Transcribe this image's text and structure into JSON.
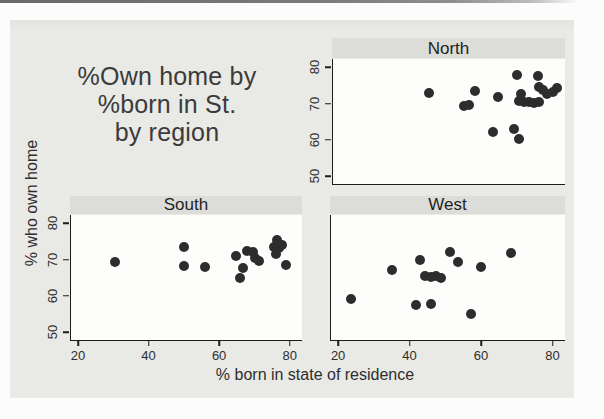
{
  "chart_data": {
    "type": "scatter",
    "title_lines": [
      "%Own home by",
      "%born in St.",
      "by region"
    ],
    "xlabel": "% born in state of residence",
    "ylabel": "% who own home",
    "facet_by": "region",
    "x_ticks": [
      20,
      40,
      60,
      80
    ],
    "y_ticks": [
      80,
      70,
      60,
      50
    ],
    "xlim": [
      18,
      83.5
    ],
    "ylim": [
      47.8,
      82.3
    ],
    "grid": false,
    "legend_position": "none",
    "panels": [
      {
        "label": "North",
        "position": "top-right",
        "show_y_tick_labels": true,
        "show_x_tick_labels": false,
        "points": [
          [
            45,
            73
          ],
          [
            58,
            73.5
          ],
          [
            55,
            69.2
          ],
          [
            56.5,
            69.7
          ],
          [
            64.5,
            71.7
          ],
          [
            70,
            77.8
          ],
          [
            71,
            72.7
          ],
          [
            70.5,
            70.8
          ],
          [
            72,
            70.4
          ],
          [
            73.3,
            70.5
          ],
          [
            74.7,
            70.1
          ],
          [
            76.1,
            70.4
          ],
          [
            76,
            77.5
          ],
          [
            76.2,
            74.7
          ],
          [
            77.3,
            73.8
          ],
          [
            78.4,
            72.6
          ],
          [
            80.2,
            73.3
          ],
          [
            81.3,
            74.3
          ],
          [
            63.3,
            62.2
          ],
          [
            69.1,
            63.1
          ],
          [
            70.5,
            60.1
          ]
        ]
      },
      {
        "label": "South",
        "position": "bottom-left",
        "show_y_tick_labels": true,
        "show_x_tick_labels": true,
        "points": [
          [
            30.5,
            69.3
          ],
          [
            50,
            73.4
          ],
          [
            50,
            68.2
          ],
          [
            56,
            68
          ],
          [
            64.9,
            71.1
          ],
          [
            66.8,
            67.7
          ],
          [
            65.9,
            65
          ],
          [
            68,
            72.5
          ],
          [
            69.6,
            72.2
          ],
          [
            70.3,
            70.4
          ],
          [
            71.3,
            69.5
          ],
          [
            75.5,
            73.6
          ],
          [
            76.5,
            75.4
          ],
          [
            77.1,
            73.1
          ],
          [
            77.9,
            74.1
          ],
          [
            76,
            71.4
          ],
          [
            79,
            68.6
          ]
        ]
      },
      {
        "label": "West",
        "position": "bottom-right",
        "show_y_tick_labels": false,
        "show_x_tick_labels": true,
        "points": [
          [
            23.5,
            59
          ],
          [
            35,
            67
          ],
          [
            43,
            70
          ],
          [
            41.7,
            57.4
          ],
          [
            46,
            57.7
          ],
          [
            44.4,
            65.5
          ],
          [
            46.1,
            65.2
          ],
          [
            47.5,
            65.5
          ],
          [
            48.9,
            64.8
          ],
          [
            51.2,
            72
          ],
          [
            53.5,
            69.4
          ],
          [
            57.1,
            55
          ],
          [
            60.1,
            67.9
          ],
          [
            68.4,
            71.8
          ]
        ]
      }
    ]
  },
  "colors": {
    "page_bg": "#fcfcfc",
    "graph_bg": "#e9e9e6",
    "panel_title_bg": "#dcdcd8",
    "plot_bg": "#fdfdfc",
    "axis": "#1c1c1c",
    "title_text": "#3b3b3b",
    "marker": "#2d2d2d",
    "scan_line": "#6f6f6f"
  }
}
